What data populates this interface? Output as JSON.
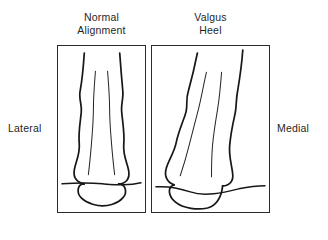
{
  "figure": {
    "background_color": "#ffffff",
    "line_color": "#171717",
    "text_color": "#1f1f1f"
  },
  "panels": [
    {
      "id": "normal",
      "title": "Normal\nAlignment",
      "title_line1": "Normal",
      "title_line2": "Alignment",
      "description": "Posterior view of lower leg and heel with normal (neutral) hindfoot alignment; Achilles tendon runs vertically and the heel sits squarely on the ground line."
    },
    {
      "id": "valgus",
      "title": "Valgus\nHeel",
      "title_line1": "Valgus",
      "title_line2": "Heel",
      "description": "Posterior view of lower leg and heel with valgus hindfoot alignment; the heel is angled outward so the Achilles tendon bows and the calcaneus tilts relative to the ground line."
    }
  ],
  "side_labels": {
    "left": "Lateral",
    "right": "Medial"
  }
}
